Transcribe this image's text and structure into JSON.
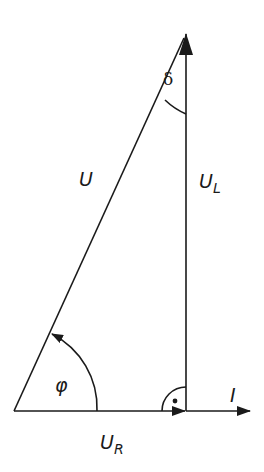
{
  "diagram": {
    "type": "phasor-diagram",
    "colors": {
      "stroke": "#1a1a1a",
      "background": "#ffffff"
    },
    "labels": {
      "total_voltage": "U",
      "inductive_voltage_main": "U",
      "inductive_voltage_sub": "L",
      "resistive_voltage_main": "U",
      "resistive_voltage_sub": "R",
      "current": "I",
      "phase_angle": "φ",
      "loss_angle": "δ",
      "right_angle_dot": "•"
    },
    "vectors": [
      {
        "name": "U",
        "from": [
          14,
          411
        ],
        "to": [
          187,
          33
        ]
      },
      {
        "name": "U_L",
        "from": [
          186,
          411
        ],
        "to": [
          186,
          33
        ]
      },
      {
        "name": "U_R",
        "from": [
          14,
          411
        ],
        "to": [
          186,
          411
        ]
      },
      {
        "name": "I",
        "from": [
          186,
          411
        ],
        "to": [
          250,
          411
        ]
      }
    ]
  }
}
